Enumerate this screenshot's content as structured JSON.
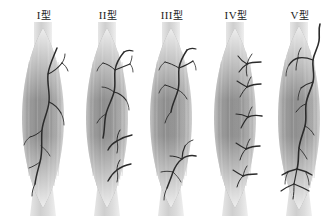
{
  "figure": {
    "background_color": "#ffffff",
    "width": 334,
    "height": 216,
    "panel_count": 5
  },
  "colors": {
    "nerve": "#2b2b2b",
    "muscle_belly_mid": "#8e8e8e",
    "muscle_belly_light": "#c9c9c9",
    "muscle_belly_dark": "#6f6f6f",
    "tendon": "#d8d8d8",
    "label_text": "#1c1c1c",
    "background": "#ffffff"
  },
  "panels": [
    {
      "id": "type-1",
      "numeral": "I",
      "suffix": "型",
      "label": "I 型",
      "x": 12,
      "description": "Single nerve trunk entering upper third, descending with sparse lateral branches"
    },
    {
      "id": "type-2",
      "numeral": "II",
      "suffix": "型",
      "label": "II 型",
      "x": 76,
      "description": "Nerve trunk with dense arborization in upper belly plus two lower accessory branches"
    },
    {
      "id": "type-3",
      "numeral": "III",
      "suffix": "型",
      "label": "III 型",
      "x": 140,
      "description": "Two separate nerve trunks, one to upper belly one to lower belly"
    },
    {
      "id": "type-4",
      "numeral": "IV",
      "suffix": "型",
      "label": "IV 型",
      "x": 204,
      "description": "Multiple short independent nerve branches entering along the lateral border"
    },
    {
      "id": "type-5",
      "numeral": "V",
      "suffix": "型",
      "label": "V 型",
      "x": 268,
      "description": "Long nerve trunk coursing the full length of the muscle with branches at both ends"
    }
  ]
}
